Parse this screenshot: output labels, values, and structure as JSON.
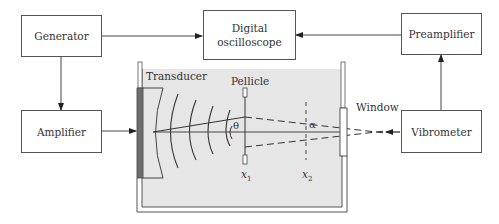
{
  "diagram": {
    "type": "experimental-setup-block-diagram",
    "blocks": {
      "generator": "Generator",
      "amplifier": "Amplifier",
      "oscilloscope_line1": "Digital",
      "oscilloscope_line2": "oscilloscope",
      "preamplifier": "Preamplifier",
      "vibrometer": "Vibrometer"
    },
    "tank_labels": {
      "transducer": "Transducer",
      "pellicle": "Pellicle",
      "window": "Window",
      "theta": "θ",
      "alpha": "α",
      "x1": "x",
      "x1_sub": "1",
      "x2": "x",
      "x2_sub": "2"
    },
    "connections": [
      {
        "from": "Generator",
        "to": "Digital oscilloscope"
      },
      {
        "from": "Generator",
        "to": "Amplifier"
      },
      {
        "from": "Amplifier",
        "to": "Transducer"
      },
      {
        "from": "Preamplifier",
        "to": "Digital oscilloscope"
      },
      {
        "from": "Vibrometer",
        "to": "Preamplifier"
      },
      {
        "from": "Vibrometer",
        "to": "Window (laser beam)"
      }
    ],
    "colors": {
      "line": "#444444",
      "water": "#e6e6e6",
      "transducer": "#6e6e6e"
    }
  }
}
